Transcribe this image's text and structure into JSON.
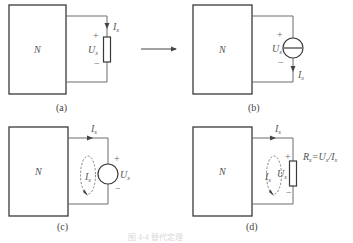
{
  "figure": {
    "caption": "",
    "caption_faint": "图 4-4  替代定理",
    "arrow": "→",
    "panels": [
      {
        "id": "a",
        "label": "(a)",
        "network": "N",
        "element": "resistor",
        "voltage_label": "U",
        "voltage_sub": "x",
        "current_label": "I",
        "current_sub": "x",
        "plus": "+",
        "minus": "−"
      },
      {
        "id": "b",
        "label": "(b)",
        "network": "N",
        "element": "current-source",
        "voltage_label": "U",
        "voltage_sub": "x",
        "current_label": "I",
        "current_sub": "x",
        "plus": "+",
        "minus": "−"
      },
      {
        "id": "c",
        "label": "(c)",
        "network": "N",
        "element": "voltage-source",
        "voltage_label": "U",
        "voltage_sub": "x",
        "current_label": "I",
        "current_sub": "x",
        "loop_label": "I",
        "loop_sub": "x",
        "plus": "+",
        "minus": "−"
      },
      {
        "id": "d",
        "label": "(d)",
        "network": "N",
        "element": "resistor",
        "voltage_label": "U",
        "voltage_sub": "x",
        "current_label": "I",
        "current_sub": "x",
        "loop_label": "I",
        "loop_sub": "x",
        "resistance_R": "R",
        "resistance_eq": "=U",
        "resistance_div": "/I",
        "sub": "x",
        "plus": "+",
        "minus": "−"
      }
    ]
  }
}
